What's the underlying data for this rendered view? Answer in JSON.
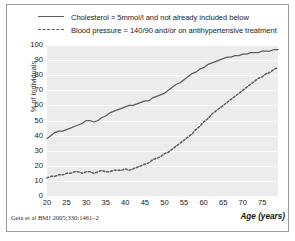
{
  "figure": {
    "citation": "Getz et al BMJ 2005;330:1461–2"
  },
  "legend": {
    "position": "top",
    "items": [
      {
        "label": "Cholesterol = 5mmol/l and not already included below",
        "style": "solid",
        "color": "#5d5d5d"
      },
      {
        "label": "Blood pressure = 140/90 and/or on antihypertensive treatment",
        "style": "dashed",
        "color": "#5d5d5d"
      }
    ]
  },
  "chart_data": {
    "type": "line",
    "title": "",
    "subtitle": "",
    "xlabel": "Age (years)",
    "ylabel": "% of individuals",
    "xlim": [
      20,
      79
    ],
    "ylim": [
      0,
      100
    ],
    "xticks": [
      20,
      25,
      30,
      35,
      40,
      45,
      50,
      55,
      60,
      65,
      70,
      75
    ],
    "yticks": [
      0,
      10,
      20,
      30,
      40,
      50,
      60,
      70,
      80,
      90,
      100
    ],
    "grid": "horizontal",
    "legend_position": "above-plot",
    "plot_background": "#ececed",
    "line_color": "#5d5d5d",
    "x": [
      20,
      21,
      22,
      23,
      24,
      25,
      26,
      27,
      28,
      29,
      30,
      31,
      32,
      33,
      34,
      35,
      36,
      37,
      38,
      39,
      40,
      41,
      42,
      43,
      44,
      45,
      46,
      47,
      48,
      49,
      50,
      51,
      52,
      53,
      54,
      55,
      56,
      57,
      58,
      59,
      60,
      61,
      62,
      63,
      64,
      65,
      66,
      67,
      68,
      69,
      70,
      71,
      72,
      73,
      74,
      75,
      76,
      77,
      78,
      79
    ],
    "series": [
      {
        "name": "Cholesterol = 5mmol/l and not already included below",
        "style": "solid",
        "values": [
          38,
          40,
          42,
          43,
          43,
          44,
          45,
          46,
          47,
          48,
          50,
          50,
          49,
          50,
          52,
          53,
          55,
          56,
          57,
          58,
          59,
          60,
          60,
          61,
          62,
          63,
          63,
          65,
          66,
          67,
          68,
          70,
          72,
          74,
          75,
          77,
          79,
          81,
          82,
          84,
          85,
          87,
          88,
          89,
          90,
          91,
          92,
          92,
          93,
          93,
          94,
          94,
          95,
          95,
          95,
          96,
          96,
          96,
          97,
          97
        ]
      },
      {
        "name": "Blood pressure = 140/90 and/or on antihypertensive treatment",
        "style": "dashed",
        "values": [
          12,
          13,
          13,
          14,
          14,
          15,
          15,
          16,
          16,
          15,
          16,
          16,
          15,
          16,
          17,
          16,
          16,
          17,
          17,
          17,
          18,
          17,
          18,
          19,
          20,
          21,
          22,
          24,
          25,
          26,
          28,
          29,
          31,
          33,
          35,
          37,
          39,
          41,
          44,
          46,
          49,
          51,
          54,
          56,
          58,
          60,
          62,
          64,
          66,
          68,
          70,
          72,
          74,
          76,
          78,
          79,
          81,
          82,
          84,
          85
        ]
      }
    ]
  }
}
